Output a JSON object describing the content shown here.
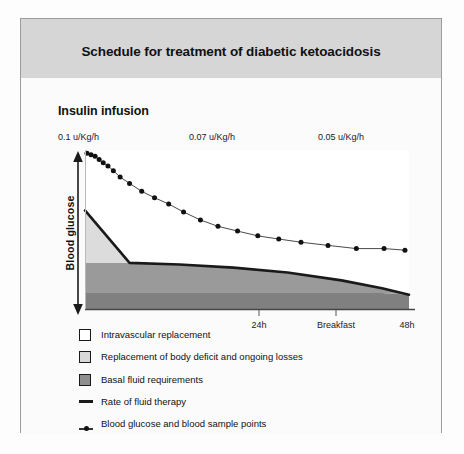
{
  "figure": {
    "title": "Schedule for treatment of diabetic ketoacidosis",
    "subtitle": "Insulin infusion"
  },
  "colors": {
    "title_band": "#d6d6d6",
    "panel_border": "#9d9d9d",
    "intravascular": "#ffffff",
    "body_deficit": "#d9d9d9",
    "basal_fluid": "#9a9a9a",
    "basal_band_dark": "#808080",
    "fluid_line": "#1a1a1a",
    "glucose_line": "#555555",
    "glucose_point": "#111111",
    "text": "#111111"
  },
  "chart_data": {
    "type": "area",
    "title": "Schedule for treatment of diabetic ketoacidosis",
    "subtitle": "Insulin infusion",
    "xlabel": "",
    "ylabel": "Blood glucose",
    "xlim": [
      0,
      48
    ],
    "ylim": [
      0,
      100
    ],
    "grid": false,
    "legend_position": "below-left",
    "x_tick_labels": [
      "24h",
      "Breakfast",
      "48h"
    ],
    "x_tick_values": [
      24,
      31,
      48
    ],
    "x_ticks_drawn": [
      24,
      31
    ],
    "dose_annotations": [
      {
        "label": "0.1 u/Kg/h",
        "x": 0
      },
      {
        "label": "0.07 u/Kg/h",
        "x": 18.5
      },
      {
        "label": "0.05 u/Kg/h",
        "x": 40
      }
    ],
    "series": [
      {
        "name": "Intravascular replacement",
        "type": "area-band",
        "swatch": "#ffffff",
        "x": [
          0,
          48
        ],
        "upper": [
          100,
          100
        ],
        "lower_is_fluid_rate": true
      },
      {
        "name": "Replacement of body deficit and ongoing losses",
        "type": "area-band",
        "swatch": "#d9d9d9",
        "x": [
          0,
          6.6,
          48
        ],
        "upper": [
          62,
          29,
          29
        ],
        "note": "wedge tapering from left down to the basal band"
      },
      {
        "name": "Basal fluid requirements",
        "type": "area-band",
        "swatch": "#9a9a9a",
        "x": [
          0,
          48
        ],
        "upper": [
          10,
          10
        ],
        "lower": [
          0,
          0
        ]
      },
      {
        "name": "Rate of fluid therapy",
        "type": "line",
        "swatch": "line",
        "x": [
          0,
          6.6,
          14,
          22,
          30,
          38,
          44,
          48
        ],
        "y": [
          62,
          29,
          28,
          26,
          23,
          18,
          13,
          9
        ]
      },
      {
        "name": "Blood glucose and blood sample points",
        "type": "line-markers",
        "swatch": "point",
        "x": [
          0.3,
          0.9,
          1.5,
          2.1,
          2.7,
          3.4,
          4.2,
          5.2,
          6.6,
          8.4,
          10.3,
          12.4,
          14.6,
          17.1,
          19.7,
          22.6,
          25.6,
          28.7,
          32.0,
          36.0,
          40.2,
          44.3,
          47.4
        ],
        "y": [
          98,
          97,
          96,
          94,
          92,
          90,
          87,
          83,
          79,
          74,
          70,
          66,
          61,
          56,
          52,
          49,
          46,
          44,
          42,
          40,
          38,
          38,
          37
        ]
      }
    ]
  },
  "legend": {
    "items": [
      {
        "label": "Intravascular replacement",
        "kind": "swatch",
        "color": "#ffffff"
      },
      {
        "label": "Replacement of body deficit and ongoing losses",
        "kind": "swatch",
        "color": "#d9d9d9"
      },
      {
        "label": "Basal fluid requirements",
        "kind": "swatch",
        "color": "#9a9a9a"
      },
      {
        "label": "Rate of fluid therapy",
        "kind": "line",
        "color": "#1a1a1a"
      },
      {
        "label": "Blood glucose and blood sample points",
        "kind": "point",
        "color": "#111111"
      }
    ]
  }
}
